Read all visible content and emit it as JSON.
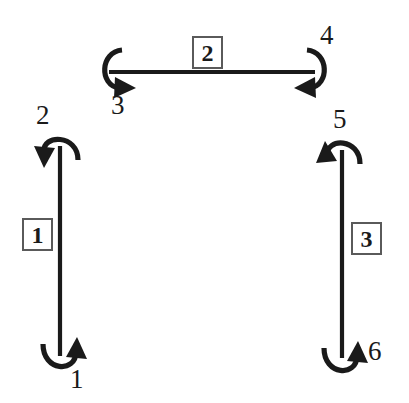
{
  "diagram": {
    "background_color": "#ffffff",
    "stroke_color": "#1a1a1a",
    "box_border_color": "#5a5a5a",
    "links": [
      {
        "id": "link-1",
        "label": "1",
        "orientation": "vertical",
        "box_position": {
          "x": 22,
          "y": 218
        }
      },
      {
        "id": "link-2",
        "label": "2",
        "orientation": "horizontal",
        "box_position": {
          "x": 192,
          "y": 36
        }
      },
      {
        "id": "link-3",
        "label": "3",
        "orientation": "vertical",
        "box_position": {
          "x": 351,
          "y": 222
        }
      }
    ],
    "joints": [
      {
        "id": "joint-1",
        "label": "1",
        "location": "bottom-left",
        "arrow_direction": "up-right",
        "label_position": {
          "x": 70,
          "y": 366
        }
      },
      {
        "id": "joint-2",
        "label": "2",
        "location": "top-left",
        "arrow_direction": "down-left",
        "label_position": {
          "x": 36,
          "y": 102
        }
      },
      {
        "id": "joint-3",
        "label": "3",
        "location": "horizontal-left-end",
        "arrow_direction": "right",
        "label_position": {
          "x": 111,
          "y": 92
        }
      },
      {
        "id": "joint-4",
        "label": "4",
        "location": "horizontal-right-end",
        "arrow_direction": "left",
        "label_position": {
          "x": 320,
          "y": 22
        }
      },
      {
        "id": "joint-5",
        "label": "5",
        "location": "top-right",
        "arrow_direction": "up-left",
        "label_position": {
          "x": 333,
          "y": 106
        }
      },
      {
        "id": "joint-6",
        "label": "6",
        "location": "bottom-right",
        "arrow_direction": "up-right",
        "label_position": {
          "x": 368,
          "y": 338
        }
      }
    ]
  }
}
